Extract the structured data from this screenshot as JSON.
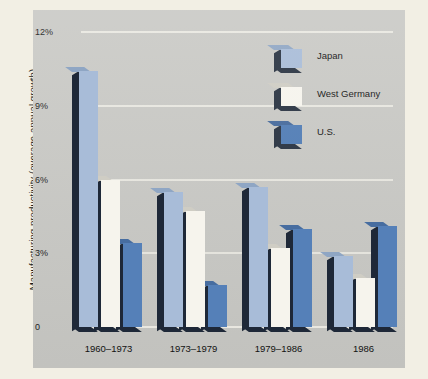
{
  "chart_data": {
    "type": "bar",
    "title": "",
    "xlabel": "",
    "ylabel": "Manufacturing productivity (overage annual growth)",
    "categories": [
      "1960–1973",
      "1973–1979",
      "1979–1986",
      "1986"
    ],
    "series": [
      {
        "name": "Japan",
        "color": "#a8bcd8",
        "values": [
          10.4,
          5.5,
          5.7,
          2.9
        ]
      },
      {
        "name": "West Germany",
        "color": "#f6f4ed",
        "values": [
          6.0,
          4.7,
          3.2,
          2.0
        ]
      },
      {
        "name": "U.S.",
        "color": "#5580b8",
        "values": [
          3.4,
          1.7,
          4.0,
          4.1
        ]
      }
    ],
    "ylim": [
      0,
      12
    ],
    "ytick_labels": [
      "0",
      "3%",
      "6%",
      "9%",
      "12%"
    ],
    "ytick_values": [
      0,
      3,
      6,
      9,
      12
    ],
    "grid": true,
    "gridlines_at": [
      3,
      6,
      9
    ],
    "legend_position": "top-right",
    "units": "percent"
  },
  "legend": {
    "items": [
      {
        "label": "Japan"
      },
      {
        "label": "West Germany"
      },
      {
        "label": "U.S."
      }
    ]
  },
  "colors": {
    "page_background": "#f2efe4",
    "panel_background": "#c9c9c5",
    "gridline": "#eceae3",
    "bar_shadow": "#1e2838",
    "text": "#111111"
  }
}
